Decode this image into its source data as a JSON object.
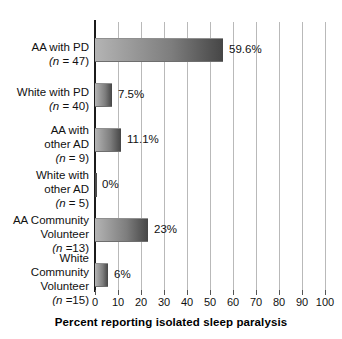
{
  "chart_data": {
    "type": "bar",
    "orientation": "horizontal",
    "title": "",
    "xlabel": "Percent reporting isolated sleep paralysis",
    "ylabel": "",
    "xlim": [
      0,
      100
    ],
    "xticks": [
      0,
      10,
      20,
      30,
      40,
      50,
      60,
      70,
      80,
      90,
      100
    ],
    "grid": true,
    "legend": false,
    "categories": [
      "AA with PD (n = 47)",
      "White with PD (n = 40)",
      "AA with other AD (n = 9)",
      "White with other AD (n = 5)",
      "AA Community Volunteer (n =13)",
      "White Community Volunteer (n =15)"
    ],
    "values": [
      59.6,
      7.5,
      11.1,
      0,
      23,
      6
    ],
    "bar_pixel_values": [
      55.6,
      7.4,
      11.3,
      0,
      23.0,
      5.7
    ],
    "data_labels": [
      "59.6%",
      "7.5%",
      "11.1%",
      "0%",
      "23%",
      "6%"
    ]
  },
  "axis": {
    "title": "Percent reporting isolated sleep paralysis",
    "tick_labels": [
      "0",
      "10",
      "20",
      "30",
      "40",
      "50",
      "60",
      "70",
      "80",
      "90",
      "100"
    ]
  },
  "rows": [
    {
      "id": "aa-with-pd",
      "label_lines": [
        "AA with PD",
        "(n = 47)"
      ],
      "name_line": "AA with PD",
      "n_prefix": "(n",
      "n_suffix": " = 47)",
      "value_label": "59.6%"
    },
    {
      "id": "white-with-pd",
      "label_lines": [
        "White with PD",
        "(n = 40)"
      ],
      "name_line": "White with PD",
      "n_prefix": "(n",
      "n_suffix": " = 40)",
      "value_label": "7.5%"
    },
    {
      "id": "aa-with-other-ad",
      "label_lines": [
        "AA with",
        "other AD",
        "(n = 9)"
      ],
      "name_line_1": "AA with",
      "name_line_2": "other AD",
      "n_prefix": "(n",
      "n_suffix": " = 9)",
      "value_label": "11.1%"
    },
    {
      "id": "white-with-other-ad",
      "label_lines": [
        "White with",
        "other AD",
        "(n = 5)"
      ],
      "name_line_1": "White with",
      "name_line_2": "other AD",
      "n_prefix": "(n",
      "n_suffix": " = 5)",
      "value_label": "0%"
    },
    {
      "id": "aa-community-volunteer",
      "label_lines": [
        "AA Community",
        "Volunteer",
        "(n =13)"
      ],
      "name_line_1": "AA Community",
      "name_line_2": "Volunteer",
      "n_prefix": "(n",
      "n_suffix": " =13)",
      "value_label": "23%"
    },
    {
      "id": "white-community-volunteer",
      "label_lines": [
        "White",
        "Community",
        "Volunteer",
        "(n =15)"
      ],
      "name_line_1": "White",
      "name_line_2": "Community",
      "name_line_3": "Volunteer",
      "n_prefix": "(n",
      "n_suffix": " =15)",
      "value_label": "6%"
    }
  ],
  "colors": {
    "bar_light": "#b4b4b4",
    "bar_dark": "#464646",
    "axis": "#1b1b1b",
    "grid": "#b9b9b9",
    "text": "#111111",
    "background": "#ffffff"
  }
}
